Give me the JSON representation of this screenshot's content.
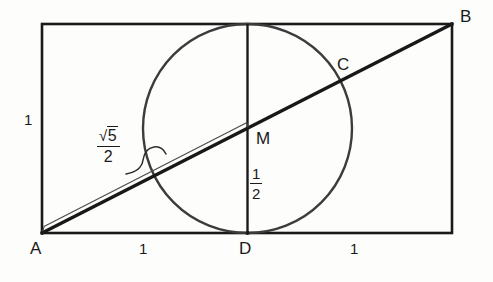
{
  "figure": {
    "type": "geometry-diagram",
    "background_color": "#fdfdfc",
    "stroke_color": "#1a1a1a",
    "thin_stroke_color": "#3a3a3a"
  },
  "labels": {
    "vertex_a": "A",
    "vertex_b": "B",
    "vertex_c": "C",
    "vertex_d": "D",
    "vertex_m": "M",
    "left_side_length": "1",
    "bottom_left_length": "1",
    "bottom_right_length": "1",
    "hypotenuse_numerator": "5",
    "hypotenuse_denominator": "2",
    "radical_sign": "√",
    "half_numerator": "1",
    "half_denominator": "2"
  },
  "geometry": {
    "rectangle": {
      "x": 42,
      "y": 24,
      "width": 410,
      "height": 209
    },
    "circle": {
      "cx": 247.5,
      "cy": 128.5,
      "r": 104.5
    },
    "vertical_line": {
      "x": 247.5,
      "y1": 24,
      "y2": 233
    },
    "diagonal": {
      "x1": 42,
      "y1": 233,
      "x2": 452,
      "y2": 24
    },
    "midpoint_m": {
      "x": 247.5,
      "y": 128.5
    },
    "point_c": {
      "x": 343,
      "y": 87
    },
    "measure_strip": {
      "from_x": 42,
      "from_y": 233,
      "to_x": 247,
      "to_y": 128
    }
  },
  "label_positions": {
    "a": {
      "x": 30,
      "y": 240
    },
    "b": {
      "x": 460,
      "y": 8
    },
    "c": {
      "x": 337,
      "y": 56
    },
    "d": {
      "x": 239,
      "y": 240
    },
    "m": {
      "x": 256,
      "y": 130
    },
    "left_one": {
      "x": 24,
      "y": 112
    },
    "bottom_left_one": {
      "x": 139,
      "y": 241
    },
    "bottom_right_one": {
      "x": 350,
      "y": 241
    },
    "root_five_frac": {
      "x": 97,
      "y": 128
    },
    "one_half_frac": {
      "x": 250,
      "y": 166
    }
  }
}
